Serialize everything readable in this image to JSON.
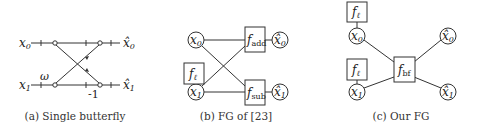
{
  "panels": [
    {
      "id": "a",
      "caption": "(a) Single butterfly",
      "inputs": [
        "x0",
        "x1"
      ],
      "outputs": [
        "x̂0",
        "x̂1"
      ],
      "labels": {
        "x0_base": "x",
        "x0_sub": "0",
        "x1_base": "x",
        "x1_sub": "1",
        "y0_base": "x̂",
        "y0_sub": "0",
        "y1_base": "x̂",
        "y1_sub": "1",
        "twiddle": "ω",
        "neg": "-1"
      }
    },
    {
      "id": "b",
      "caption": "(b) FG of [23]",
      "labels": {
        "x0_base": "x",
        "x0_sub": "0",
        "x1_base": "x",
        "x1_sub": "1",
        "y0_base": "x̂",
        "y0_sub": "0",
        "y1_base": "x̂",
        "y1_sub": "1",
        "fl_base": "f",
        "fl_sub": "ℓ",
        "fadd_base": "f",
        "fadd_sub": "add",
        "fsub_base": "f",
        "fsub_sub": "sub"
      }
    },
    {
      "id": "c",
      "caption": "(c) Our FG",
      "labels": {
        "x0_base": "x",
        "x0_sub": "0",
        "x1_base": "x",
        "x1_sub": "1",
        "y0_base": "x̂",
        "y0_sub": "0",
        "y1_base": "x̂",
        "y1_sub": "1",
        "fl_base": "f",
        "fl_sub": "ℓ",
        "fbf_base": "f",
        "fbf_sub": "bf"
      }
    }
  ],
  "colors": {
    "stroke": "#333333",
    "background": "#ffffff"
  }
}
